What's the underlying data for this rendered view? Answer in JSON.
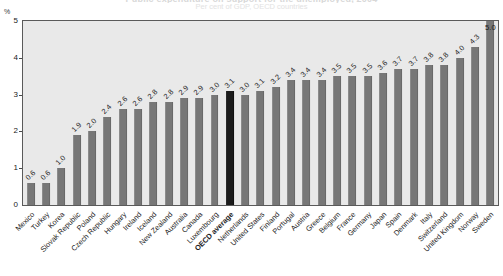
{
  "header": {
    "title_ghost": "Public expenditure on support for the unemployed, 2004",
    "subtitle_ghost": "Per cent of GDP, OECD countries",
    "unit_label": "%"
  },
  "chart_data": {
    "type": "bar",
    "title": "Public expenditure on support for the unemployed, 2004",
    "subtitle": "Per cent of GDP, OECD countries",
    "xlabel": "",
    "ylabel": "%",
    "ylim": [
      0,
      5
    ],
    "yticks": [
      0,
      1,
      2,
      3,
      4,
      5
    ],
    "grid": false,
    "legend": "none",
    "highlight_category": "OECD average",
    "highlight_color": "#1b1b1b",
    "bar_color": "#777777",
    "plot_background": "#e9e9e9",
    "categories": [
      "Mexico",
      "Turkey",
      "Korea",
      "Slovak Republic",
      "Poland",
      "Czech Republic",
      "Hungary",
      "Ireland",
      "Iceland",
      "New Zealand",
      "Australia",
      "Canada",
      "Luxembourg",
      "OECD average",
      "Netherlands",
      "United States",
      "Finland",
      "Portugal",
      "Austria",
      "Greece",
      "Belgium",
      "France",
      "Germany",
      "Japan",
      "Spain",
      "Denmark",
      "Italy",
      "Switzerland",
      "United Kingdom",
      "Norway",
      "Sweden"
    ],
    "values": [
      0.6,
      0.6,
      1.0,
      1.9,
      2.0,
      2.4,
      2.6,
      2.6,
      2.8,
      2.8,
      2.9,
      2.9,
      3.0,
      3.1,
      3.0,
      3.1,
      3.2,
      3.4,
      3.4,
      3.4,
      3.5,
      3.5,
      3.5,
      3.6,
      3.7,
      3.7,
      3.8,
      3.8,
      4.0,
      4.3,
      5.0
    ],
    "value_labels": [
      "0.6",
      "0.6",
      "1.0",
      "1.9",
      "2.0",
      "2.4",
      "2.6",
      "2.6",
      "2.8",
      "2.8",
      "2.9",
      "2.9",
      "3.0",
      "3.1",
      "3.0",
      "3.1",
      "3.2",
      "3.4",
      "3.4",
      "3.4",
      "3.5",
      "3.5",
      "3.5",
      "3.6",
      "3.7",
      "3.7",
      "3.8",
      "3.8",
      "4.0",
      "4.3",
      "5.0"
    ]
  }
}
